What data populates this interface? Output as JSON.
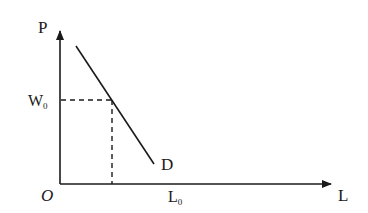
{
  "diagram": {
    "type": "labor-demand-curve",
    "axes": {
      "y_label": "P",
      "x_label": "L",
      "origin_label": "O"
    },
    "curve": {
      "label": "D",
      "description": "downward-sloping straight demand line"
    },
    "reference": {
      "wage_label_main": "W",
      "wage_label_sub": "0",
      "quantity_label_main": "L",
      "quantity_label_sub": "0"
    },
    "colors": {
      "line": "#1a1a1a",
      "background": "#ffffff"
    }
  }
}
